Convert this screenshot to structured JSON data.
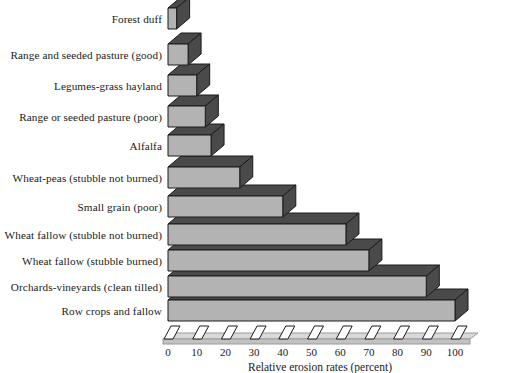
{
  "chart_data": {
    "type": "bar",
    "orientation": "horizontal",
    "style": "3d-isometric",
    "title": "",
    "subtitle": "",
    "xlabel": "Relative erosion rates (percent)",
    "ylabel": "",
    "xlim": [
      0,
      105
    ],
    "xticks": [
      0,
      10,
      20,
      30,
      40,
      50,
      60,
      70,
      80,
      90,
      100
    ],
    "xtick_labels": [
      "0",
      "10",
      "20",
      "30",
      "40",
      "50",
      "60",
      "70",
      "80",
      "90",
      "100"
    ],
    "grid": false,
    "legend": null,
    "categories": [
      "Forest duff",
      "Range and seeded pasture (good)",
      "Legumes-grass hayland",
      "Range or seeded pasture (poor)",
      "Alfalfa",
      "Wheat-peas (stubble not burned)",
      "Small grain (poor)",
      "Wheat fallow (stubble not burned)",
      "Wheat fallow (stubble burned)",
      "Orchards-vineyards (clean tilled)",
      "Row crops and fallow"
    ],
    "values": [
      3,
      7,
      10,
      13,
      15,
      25,
      40,
      62,
      70,
      90,
      100
    ],
    "colors": {
      "bar_front": "#b3b3b3",
      "bar_top": "#4a4a4a",
      "bar_side": "#4a4a4a",
      "bar_outline": "#1a1a1a",
      "axis_line": "#9a9a9a",
      "text": "#1a1a1a",
      "background": "#ffffff"
    }
  },
  "axis": {
    "title": "Relative erosion rates (percent)"
  }
}
